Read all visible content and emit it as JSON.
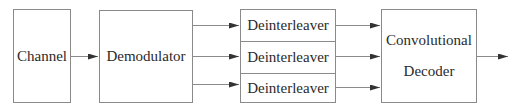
{
  "diagram": {
    "type": "block-diagram",
    "blocks": {
      "channel": {
        "label": "Channel"
      },
      "demodulator": {
        "label": "Demodulator"
      },
      "deinterleavers": [
        {
          "label": "Deinterleaver"
        },
        {
          "label": "Deinterleaver"
        },
        {
          "label": "Deinterleaver"
        }
      ],
      "decoder": {
        "label_line1": "Convolutional",
        "label_line2": "Decoder"
      }
    },
    "connections": [
      {
        "from": "channel",
        "to": "demodulator"
      },
      {
        "from": "demodulator",
        "to": "deinterleaver-1"
      },
      {
        "from": "demodulator",
        "to": "deinterleaver-2"
      },
      {
        "from": "demodulator",
        "to": "deinterleaver-3"
      },
      {
        "from": "deinterleaver-1",
        "to": "decoder"
      },
      {
        "from": "deinterleaver-2",
        "to": "decoder"
      },
      {
        "from": "deinterleaver-3",
        "to": "decoder"
      },
      {
        "from": "decoder",
        "to": "output"
      }
    ],
    "colors": {
      "line": "#8a8a8a",
      "arrow": "#333333",
      "text": "#2a2a2a"
    }
  }
}
